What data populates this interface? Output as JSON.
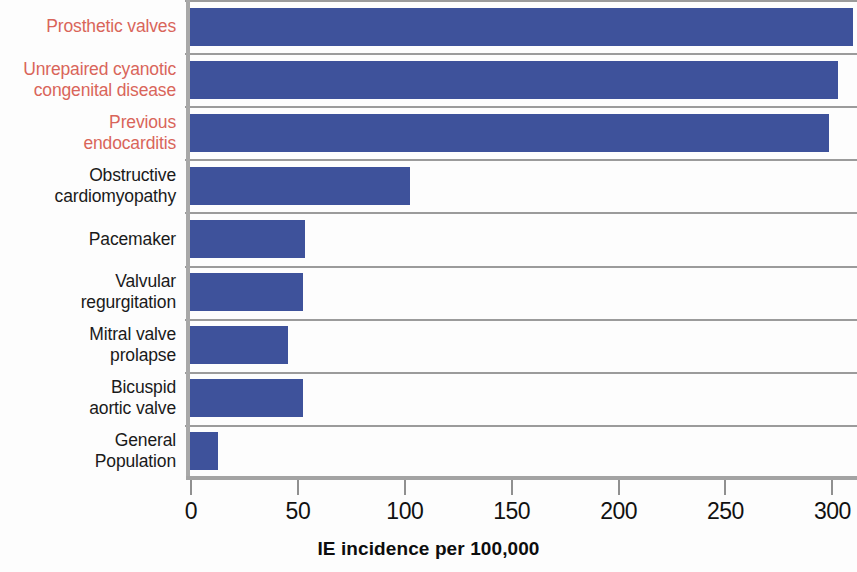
{
  "chart_data": {
    "type": "bar",
    "orientation": "horizontal",
    "title": "",
    "xlabel": "IE incidence per 100,000",
    "ylabel": "",
    "xlim": [
      0,
      312
    ],
    "xticks": [
      0,
      50,
      100,
      150,
      200,
      250,
      300
    ],
    "xtick_labels": [
      "0",
      "50",
      "100",
      "150",
      "200",
      "250",
      "300"
    ],
    "grid": true,
    "legend": null,
    "bar_color": "#3e529b",
    "highlight_label_color": "#d9655a",
    "normal_label_color": "#1a1a1a",
    "categories": [
      "Prosthetic valves",
      "Unrepaired cyanotic\ncongenital disease",
      "Previous\nendocarditis",
      "Obstructive\ncardiomyopathy",
      "Pacemaker",
      "Valvular\nregurgitation",
      "Mitral valve\nprolapse",
      "Bicuspid\naortic valve",
      "General\nPopulation"
    ],
    "values": [
      310,
      303,
      299,
      103,
      54,
      53,
      46,
      53,
      13
    ],
    "highlighted": [
      true,
      true,
      true,
      false,
      false,
      false,
      false,
      false,
      false
    ]
  }
}
